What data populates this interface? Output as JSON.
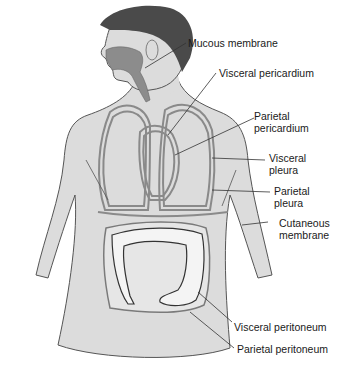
{
  "figure": {
    "colors": {
      "skin": "#dcdcdc",
      "hair": "#4a4a4a",
      "mucosa": "#8c8c8c",
      "outline": "#555555",
      "membrane": "#8a8a8a",
      "intestine": "#f4f4f4",
      "leader_line": "#333333"
    }
  },
  "labels": [
    {
      "id": "mucous",
      "text": "Mucous membrane"
    },
    {
      "id": "visc_peri",
      "text": "Visceral pericardium"
    },
    {
      "id": "par_peri",
      "text": "Parietal\npericardium"
    },
    {
      "id": "visc_pleura",
      "text": "Visceral\npleura"
    },
    {
      "id": "par_pleura",
      "text": "Parietal\npleura"
    },
    {
      "id": "cutaneous",
      "text": "Cutaneous\nmembrane"
    },
    {
      "id": "visc_periton",
      "text": "Visceral peritoneum"
    },
    {
      "id": "par_periton",
      "text": "Parietal peritoneum"
    }
  ]
}
